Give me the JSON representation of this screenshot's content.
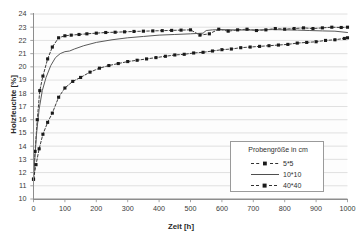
{
  "chart_data": {
    "type": "line",
    "title": "",
    "xlabel": "Zeit [h]",
    "ylabel": "Holzfeuchte [%]",
    "xlim": [
      0,
      1000
    ],
    "ylim": [
      10,
      24
    ],
    "grid": "horizontal",
    "legend_position": "inside-lower-right",
    "legend_title": "Probengröße in cm",
    "xticks": [
      0,
      100,
      200,
      300,
      400,
      500,
      600,
      700,
      800,
      900,
      1000
    ],
    "yticks": [
      10,
      11,
      12,
      13,
      14,
      15,
      16,
      17,
      18,
      19,
      20,
      21,
      22,
      23,
      24
    ],
    "series": [
      {
        "name": "5*5",
        "marker": "filled-square",
        "linestyle": "dashed",
        "color": "#1a1a1a",
        "x": [
          0,
          5,
          12,
          20,
          30,
          45,
          60,
          80,
          100,
          120,
          145,
          170,
          200,
          230,
          260,
          290,
          320,
          350,
          380,
          410,
          440,
          470,
          500,
          530,
          560,
          590,
          620,
          650,
          680,
          710,
          740,
          770,
          800,
          830,
          860,
          890,
          920,
          950,
          980,
          1000
        ],
        "y": [
          11.5,
          13.6,
          16.0,
          18.2,
          19.3,
          20.6,
          21.5,
          22.2,
          22.35,
          22.4,
          22.45,
          22.5,
          22.55,
          22.6,
          22.62,
          22.65,
          22.68,
          22.7,
          22.72,
          22.74,
          22.76,
          22.78,
          22.8,
          22.4,
          22.5,
          22.85,
          22.7,
          22.8,
          22.85,
          22.75,
          22.8,
          22.9,
          22.85,
          22.9,
          22.95,
          22.9,
          22.95,
          23.0,
          22.98,
          23.0
        ]
      },
      {
        "name": "10*10",
        "marker": "none",
        "linestyle": "solid",
        "color": "#5a5a5a",
        "x": [
          0,
          4,
          10,
          18,
          28,
          40,
          55,
          70,
          85,
          100,
          115,
          130,
          160,
          200,
          250,
          300,
          350,
          400,
          450,
          500,
          540,
          550,
          570,
          600,
          640,
          680,
          720,
          760,
          800,
          840,
          880,
          920,
          960,
          1000
        ],
        "y": [
          11.5,
          13.0,
          15.0,
          16.8,
          18.2,
          19.2,
          20.1,
          20.7,
          21.0,
          21.15,
          21.2,
          21.35,
          21.6,
          21.85,
          22.05,
          22.2,
          22.3,
          22.4,
          22.45,
          22.5,
          22.55,
          22.75,
          22.8,
          22.82,
          22.8,
          22.78,
          22.8,
          22.82,
          22.8,
          22.78,
          22.75,
          22.72,
          22.7,
          22.6
        ]
      },
      {
        "name": "40*40",
        "marker": "filled-square",
        "linestyle": "dashed",
        "color": "#1a1a1a",
        "x": [
          0,
          8,
          18,
          30,
          45,
          60,
          80,
          100,
          125,
          150,
          180,
          210,
          240,
          270,
          300,
          330,
          360,
          390,
          420,
          450,
          480,
          510,
          540,
          570,
          600,
          630,
          660,
          690,
          720,
          750,
          780,
          810,
          840,
          870,
          900,
          930,
          960,
          990,
          1000
        ],
        "y": [
          11.5,
          12.6,
          13.8,
          14.9,
          15.8,
          16.5,
          17.7,
          18.4,
          18.9,
          19.2,
          19.6,
          19.9,
          20.1,
          20.25,
          20.4,
          20.5,
          20.6,
          20.7,
          20.8,
          20.9,
          20.95,
          21.05,
          21.1,
          21.2,
          21.3,
          21.35,
          21.45,
          21.5,
          21.55,
          21.6,
          21.65,
          21.7,
          21.8,
          21.85,
          21.9,
          22.0,
          22.05,
          22.15,
          22.2
        ]
      }
    ]
  },
  "axes": {
    "x_title": "Zeit [h]",
    "y_title": "Holzfeuchte [%]",
    "x_tick_labels": [
      "0",
      "100",
      "200",
      "300",
      "400",
      "500",
      "600",
      "700",
      "800",
      "900",
      "1000"
    ],
    "y_tick_labels": [
      "10",
      "11",
      "12",
      "13",
      "14",
      "15",
      "16",
      "17",
      "18",
      "19",
      "20",
      "21",
      "22",
      "23",
      "24"
    ]
  },
  "legend": {
    "title": "Probengröße in cm",
    "items": [
      {
        "label": "5*5"
      },
      {
        "label": "10*10"
      },
      {
        "label": "40*40"
      }
    ]
  },
  "colors": {
    "gridline": "#d8d8d8",
    "axis": "#8d8d8d",
    "series_marker": "#1a1a1a",
    "series_solid": "#5a5a5a",
    "plot_background": "#fdfdfd",
    "page_background": "#ffffff"
  }
}
